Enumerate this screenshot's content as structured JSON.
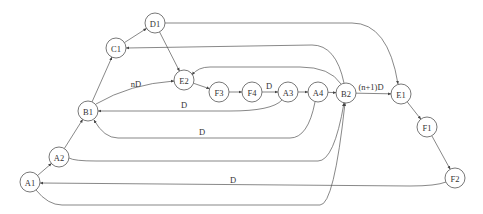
{
  "diagram": {
    "type": "directed-graph",
    "nodes": [
      {
        "id": "D1",
        "label": "D1"
      },
      {
        "id": "C1",
        "label": "C1"
      },
      {
        "id": "E2",
        "label": "E2"
      },
      {
        "id": "F3",
        "label": "F3"
      },
      {
        "id": "F4",
        "label": "F4"
      },
      {
        "id": "A3",
        "label": "A3"
      },
      {
        "id": "A4",
        "label": "A4"
      },
      {
        "id": "B2",
        "label": "B2"
      },
      {
        "id": "E1",
        "label": "E1"
      },
      {
        "id": "B1",
        "label": "B1"
      },
      {
        "id": "F1",
        "label": "F1"
      },
      {
        "id": "A2",
        "label": "A2"
      },
      {
        "id": "A1",
        "label": "A1"
      },
      {
        "id": "F2",
        "label": "F2"
      }
    ],
    "edges": [
      {
        "from": "A1",
        "to": "A2",
        "label": ""
      },
      {
        "from": "A2",
        "to": "B1",
        "label": ""
      },
      {
        "from": "B1",
        "to": "C1",
        "label": ""
      },
      {
        "from": "C1",
        "to": "D1",
        "label": ""
      },
      {
        "from": "D1",
        "to": "E2",
        "label": ""
      },
      {
        "from": "B1",
        "to": "E2",
        "label": "nD"
      },
      {
        "from": "E2",
        "to": "F3",
        "label": ""
      },
      {
        "from": "F3",
        "to": "F4",
        "label": ""
      },
      {
        "from": "F4",
        "to": "A3",
        "label": "D"
      },
      {
        "from": "A3",
        "to": "A4",
        "label": ""
      },
      {
        "from": "A4",
        "to": "B2",
        "label": ""
      },
      {
        "from": "B2",
        "to": "E1",
        "label": "(n+1)D"
      },
      {
        "from": "E1",
        "to": "F1",
        "label": ""
      },
      {
        "from": "F1",
        "to": "F2",
        "label": ""
      },
      {
        "from": "D1",
        "to": "E1",
        "label": ""
      },
      {
        "from": "B2",
        "to": "C1",
        "label": ""
      },
      {
        "from": "B2",
        "to": "E2",
        "label": ""
      },
      {
        "from": "A3",
        "to": "B1",
        "label": "D"
      },
      {
        "from": "A4",
        "to": "B1",
        "label": "D"
      },
      {
        "from": "A2",
        "to": "B2",
        "label": ""
      },
      {
        "from": "F2",
        "to": "A1",
        "label": "D"
      },
      {
        "from": "A1",
        "to": "B2",
        "label": ""
      }
    ]
  }
}
